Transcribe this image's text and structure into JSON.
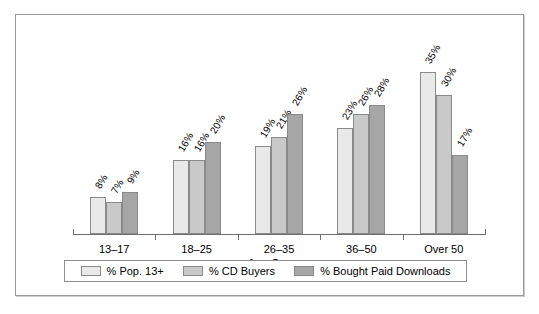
{
  "chart_data": {
    "type": "bar",
    "title": "",
    "subtitle": "",
    "xlabel": "Age Groups",
    "ylabel": "",
    "ylim": [
      0,
      40
    ],
    "grid": false,
    "legend_position": "bottom",
    "value_label_suffix": "%",
    "value_labels_rotated_deg": -60,
    "categories": [
      "13–17",
      "18–25",
      "26–35",
      "36–50",
      "Over 50"
    ],
    "series": [
      {
        "name": "% Pop. 13+",
        "color": "#e9e9e9",
        "values": [
          8,
          16,
          19,
          23,
          35
        ],
        "labels": [
          "8%",
          "16%",
          "19%",
          "23%",
          "35%"
        ]
      },
      {
        "name": "% CD Buyers",
        "color": "#c9c9c9",
        "values": [
          7,
          16,
          21,
          26,
          30
        ],
        "labels": [
          "7%",
          "16%",
          "21%",
          "26%",
          "30%"
        ]
      },
      {
        "name": "% Bought Paid Downloads",
        "color": "#a6a6a6",
        "values": [
          9,
          20,
          26,
          28,
          17
        ],
        "labels": [
          "9%",
          "20%",
          "26%",
          "28%",
          "17%"
        ]
      }
    ]
  },
  "frame": {
    "border_color": "#9b9b9b",
    "background": "#ffffff"
  },
  "axis": {
    "line_color": "#6e6e6e"
  }
}
